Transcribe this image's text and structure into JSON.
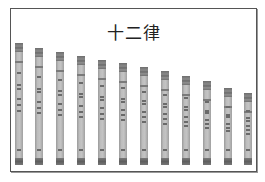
{
  "title": "十二律",
  "colors": {
    "frame_border": "#555555",
    "pipe_body": "#bdbdbd",
    "pipe_cap": "#6e6e6e"
  },
  "pipes": [
    {
      "index": 1,
      "left": 15,
      "top": 43
    },
    {
      "index": 2,
      "left": 35,
      "top": 48
    },
    {
      "index": 3,
      "left": 56,
      "top": 52
    },
    {
      "index": 4,
      "left": 77,
      "top": 56
    },
    {
      "index": 5,
      "left": 98,
      "top": 60
    },
    {
      "index": 6,
      "left": 119,
      "top": 63
    },
    {
      "index": 7,
      "left": 140,
      "top": 67
    },
    {
      "index": 8,
      "left": 161,
      "top": 71
    },
    {
      "index": 9,
      "left": 182,
      "top": 76
    },
    {
      "index": 10,
      "left": 203,
      "top": 81
    },
    {
      "index": 11,
      "left": 224,
      "top": 88
    },
    {
      "index": 12,
      "left": 244,
      "top": 93
    }
  ]
}
